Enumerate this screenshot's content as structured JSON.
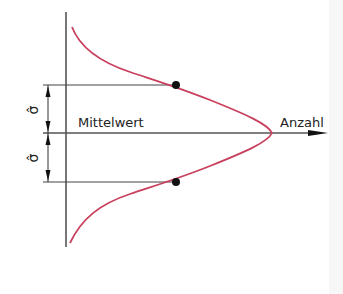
{
  "diagram": {
    "type": "normal-distribution-sketch",
    "labels": {
      "mean": "Mittelwert",
      "count_axis": "Anzahl",
      "sigma_upper": "σ̂",
      "sigma_lower": "σ̂"
    },
    "colors": {
      "curve": "#c9405e",
      "lines": "#444444",
      "points": "#111111",
      "background": "#ffffff"
    },
    "icons": {
      "axis_arrow": "arrowhead-right",
      "dimension_arrows": "double-headed-arrow"
    }
  }
}
